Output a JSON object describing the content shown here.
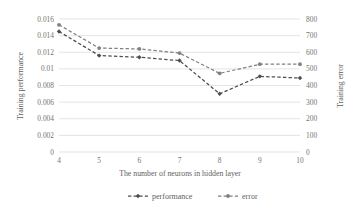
{
  "chart_data": {
    "type": "line",
    "title": "",
    "subtitle": "",
    "xlabel": "The number of neurons in hidden layer",
    "ylabel": "Training performance",
    "y2label": "Training error",
    "x": [
      4,
      5,
      6,
      7,
      8,
      9,
      10
    ],
    "categories": [
      "4",
      "5",
      "6",
      "7",
      "8",
      "9",
      "10"
    ],
    "xlim": [
      4,
      10
    ],
    "ylim": [
      0,
      0.016
    ],
    "y2lim": [
      0,
      800
    ],
    "yticks": [
      0,
      0.002,
      0.004,
      0.006,
      0.008,
      0.01,
      0.012,
      0.014,
      0.016
    ],
    "ytick_labels": [
      "0",
      "0.002",
      "0.004",
      "0.006",
      "0.008",
      "0.01",
      "0.012",
      "0.014",
      "0.016"
    ],
    "y2ticks": [
      0,
      100,
      200,
      300,
      400,
      500,
      600,
      700,
      800
    ],
    "y2tick_labels": [
      "0",
      "100",
      "200",
      "300",
      "400",
      "500",
      "600",
      "700",
      "800"
    ],
    "xtick_labels": [
      "4",
      "5",
      "6",
      "7",
      "8",
      "9",
      "10"
    ],
    "grid": "horizontal",
    "legend_position": "bottom",
    "series": [
      {
        "name": "performance",
        "axis": "left",
        "color": "#4d4d4d",
        "marker": "diamond",
        "linestyle": "dashed",
        "values": [
          0.0145,
          0.0116,
          0.0114,
          0.011,
          0.007,
          0.0091,
          0.0089
        ]
      },
      {
        "name": "error",
        "axis": "right",
        "color": "#808080",
        "marker": "circle",
        "linestyle": "dashed",
        "values": [
          765,
          625,
          620,
          595,
          473,
          528,
          528
        ]
      }
    ]
  },
  "legend": {
    "items": [
      {
        "label": "performance",
        "color": "#4d4d4d"
      },
      {
        "label": "error",
        "color": "#808080"
      }
    ]
  },
  "colors": {
    "performance": "#4d4d4d",
    "error": "#808080",
    "gridline": "#d9d9d9",
    "tick_text": "#737373",
    "background": "#ffffff"
  }
}
